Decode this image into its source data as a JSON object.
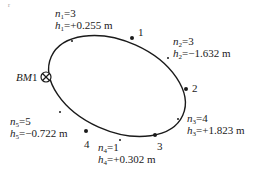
{
  "diagram": {
    "type": "closed-leveling-loop",
    "benchmark": {
      "label": "BM1",
      "prefix": "BM",
      "number": "1"
    },
    "points": [
      {
        "id": "1",
        "label": "1"
      },
      {
        "id": "2",
        "label": "2"
      },
      {
        "id": "3",
        "label": "3"
      },
      {
        "id": "4",
        "label": "4"
      }
    ],
    "sections": [
      {
        "n_label": "n",
        "n_sub": "1",
        "n_value": "=3",
        "h_label": "h",
        "h_sub": "1",
        "h_value": "=+0.255 m"
      },
      {
        "n_label": "n",
        "n_sub": "2",
        "n_value": "=3",
        "h_label": "h",
        "h_sub": "2",
        "h_value": "=−1.632 m"
      },
      {
        "n_label": "n",
        "n_sub": "3",
        "n_value": "=4",
        "h_label": "h",
        "h_sub": "3",
        "h_value": "=+1.823 m"
      },
      {
        "n_label": "n",
        "n_sub": "4",
        "n_value": "=1",
        "h_label": "h",
        "h_sub": "4",
        "h_value": "=+0.302 m"
      },
      {
        "n_label": "n",
        "n_sub": "5",
        "n_value": "=5",
        "h_label": "h",
        "h_sub": "5",
        "h_value": "=−0.722 m"
      }
    ]
  }
}
